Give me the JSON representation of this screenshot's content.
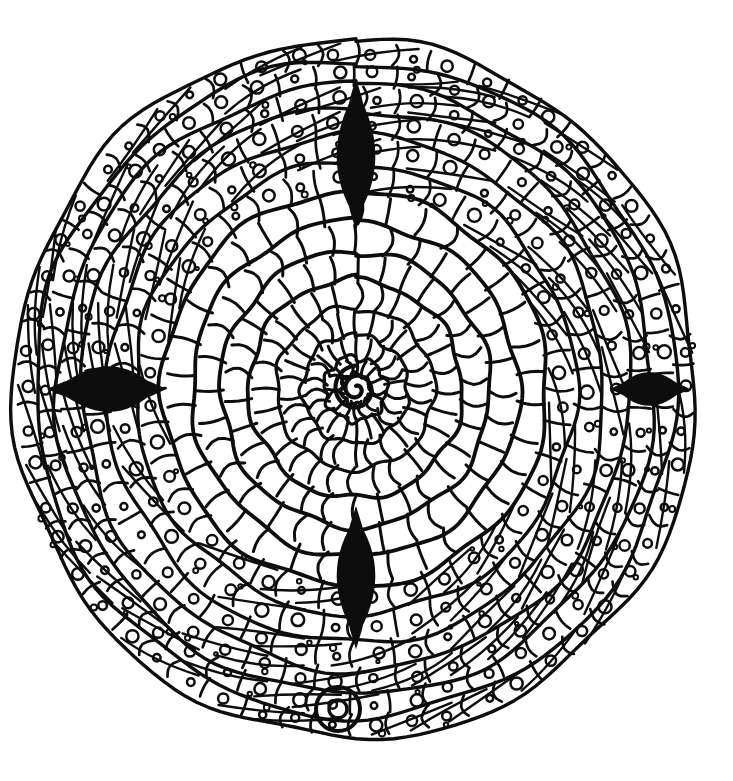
{
  "artwork": {
    "title": "Concentric Spiral Mandala Coloring Page",
    "medium": "black ink line drawing on white",
    "style": "hand-drawn zentangle labyrinth mandala",
    "background_color": "#ffffff",
    "ink_color": "#0d0d0d",
    "canvas": {
      "width": 733,
      "height": 781
    },
    "center": {
      "x": 356,
      "y": 389
    },
    "bounds": {
      "left": 22,
      "top": 41,
      "right": 702,
      "bottom": 737
    },
    "overall_radius_x": 340,
    "overall_radius_y": 348,
    "description": "A large circular mandala built from about thirteen concentric spiral bands. The innermost bands are plain cells divided by wavy radial lines; the outer bands are subdivided into small cells each holding a tiny circle. Four solid black wedge shapes mark where spiral band ends meet. A small comma-shaped spiral sits at the very center and a detached small ringed circle sits at the bottom where the spiral tail exits."
  },
  "structure": {
    "ring_count": 13,
    "center_spiral_turns": 2,
    "black_wedges": 4,
    "detached_tail_circle": 1,
    "rings": [
      {
        "index": 0,
        "r_inner": 14,
        "r_outer": 30,
        "cells": 16,
        "has_dots": false,
        "note": "center spiral core"
      },
      {
        "index": 1,
        "r_inner": 30,
        "r_outer": 52,
        "cells": 22,
        "has_dots": false,
        "note": "sunburst spokes"
      },
      {
        "index": 2,
        "r_inner": 52,
        "r_outer": 78,
        "cells": 26,
        "has_dots": false,
        "note": "plain wavy cells"
      },
      {
        "index": 3,
        "r_inner": 78,
        "r_outer": 106,
        "cells": 28,
        "has_dots": false,
        "note": "plain wavy cells"
      },
      {
        "index": 4,
        "r_inner": 106,
        "r_outer": 134,
        "cells": 30,
        "has_dots": false,
        "note": "plain wavy cells"
      },
      {
        "index": 5,
        "r_inner": 134,
        "r_outer": 163,
        "cells": 32,
        "has_dots": false,
        "note": "plain wavy cells"
      },
      {
        "index": 6,
        "r_inner": 163,
        "r_outer": 192,
        "cells": 34,
        "has_dots": false,
        "note": "plain wavy cells"
      },
      {
        "index": 7,
        "r_inner": 192,
        "r_outer": 220,
        "cells": 36,
        "has_dots": true,
        "note": "first dotted ring"
      },
      {
        "index": 8,
        "r_inner": 220,
        "r_outer": 248,
        "cells": 38,
        "has_dots": true,
        "note": "dotted cells"
      },
      {
        "index": 9,
        "r_inner": 248,
        "r_outer": 274,
        "cells": 42,
        "has_dots": true,
        "note": "dotted cells"
      },
      {
        "index": 10,
        "r_inner": 274,
        "r_outer": 298,
        "cells": 46,
        "has_dots": true,
        "note": "dotted cells"
      },
      {
        "index": 11,
        "r_inner": 298,
        "r_outer": 320,
        "cells": 50,
        "has_dots": true,
        "note": "dotted cells"
      },
      {
        "index": 12,
        "r_inner": 320,
        "r_outer": 341,
        "cells": 54,
        "has_dots": true,
        "note": "outermost dotted ring"
      }
    ],
    "wedges": [
      {
        "name": "top-wedge",
        "angle_deg": -90,
        "radius": 230,
        "length": 150,
        "width": 26
      },
      {
        "name": "left-wedge",
        "angle_deg": 180,
        "radius": 250,
        "length": 120,
        "width": 30
      },
      {
        "name": "right-wedge",
        "angle_deg": 0,
        "radius": 295,
        "length": 80,
        "width": 22
      },
      {
        "name": "bottom-wedge",
        "angle_deg": 90,
        "radius": 185,
        "length": 140,
        "width": 26
      }
    ],
    "tail": {
      "circle_cx": 338,
      "circle_cy": 709,
      "circle_r": 22,
      "inner_dot_r": 9
    }
  }
}
